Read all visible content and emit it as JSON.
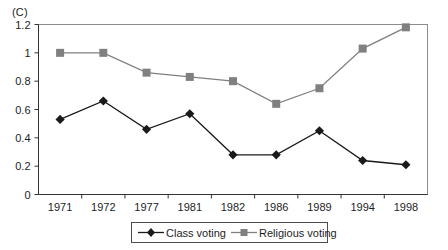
{
  "panel": {
    "label": "(C)"
  },
  "chart_data": {
    "type": "line",
    "title": "",
    "subtitle": "",
    "xlabel": "",
    "ylabel": "",
    "categories": [
      "1971",
      "1972",
      "1977",
      "1981",
      "1982",
      "1986",
      "1989",
      "1994",
      "1998"
    ],
    "series": [
      {
        "name": "Class voting",
        "marker": "diamond",
        "color": "#1a1a1a",
        "values": [
          0.53,
          0.66,
          0.46,
          0.57,
          0.28,
          0.28,
          0.45,
          0.24,
          0.21
        ]
      },
      {
        "name": "Religious voting",
        "marker": "square",
        "color": "#808080",
        "values": [
          1.0,
          1.0,
          0.86,
          0.83,
          0.8,
          0.64,
          0.75,
          1.03,
          1.18
        ]
      }
    ],
    "ylim": [
      0,
      1.2
    ],
    "yticks": [
      0,
      0.2,
      0.4,
      0.6,
      0.8,
      1,
      1.2
    ],
    "ytick_labels": [
      "0",
      "0.2",
      "0.4",
      "0.6",
      "0.8",
      "1",
      "1.2"
    ],
    "grid": false,
    "legend_position": "bottom",
    "legend": [
      "Class voting",
      "Religious voting"
    ],
    "frame": "box"
  },
  "axis": {
    "y_ticks": [
      "1.2",
      "1",
      "0.8",
      "0.6",
      "0.4",
      "0.2",
      "0"
    ],
    "x_ticks": [
      "1971",
      "1972",
      "1977",
      "1981",
      "1982",
      "1986",
      "1989",
      "1994",
      "1998"
    ]
  },
  "legend": {
    "items": [
      {
        "label": "Class voting",
        "marker": "diamond-marker",
        "color": "#1a1a1a"
      },
      {
        "label": "Religious voting",
        "marker": "square-marker",
        "color": "#808080"
      }
    ]
  },
  "colors": {
    "class_voting": "#1a1a1a",
    "religious_voting": "#808080",
    "frame": "#808080",
    "axis": "#1a1a1a",
    "background": "#ffffff"
  }
}
